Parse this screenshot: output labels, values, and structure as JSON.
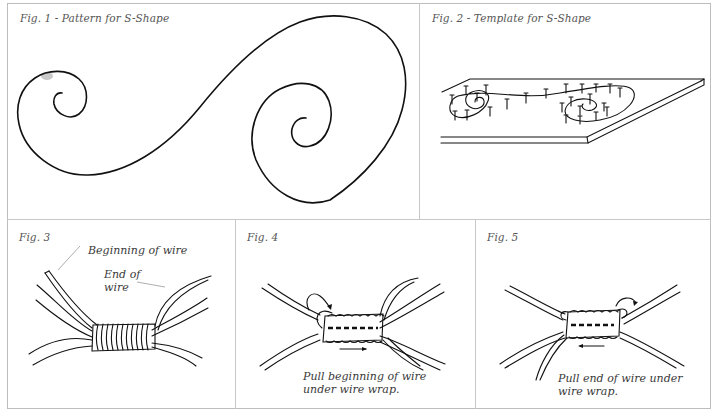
{
  "figures": [
    {
      "id": "fig1",
      "caption": "Fig. 1 - Pattern for S-Shape"
    },
    {
      "id": "fig2",
      "caption": "Fig. 2 - Template for S-Shape"
    },
    {
      "id": "fig3",
      "caption": "Fig. 3",
      "labels": {
        "beginning": "Beginning of wire",
        "end_line1": "End of",
        "end_line2": "wire"
      }
    },
    {
      "id": "fig4",
      "caption": "Fig. 4",
      "instruction_line1": "Pull beginning of wire",
      "instruction_line2": "under wire wrap."
    },
    {
      "id": "fig5",
      "caption": "Fig. 5",
      "instruction_line1": "Pull end of wire under",
      "instruction_line2": "wire wrap."
    }
  ],
  "colors": {
    "ink": "#111111",
    "caption": "#555555",
    "border": "#c8c8c8",
    "background": "#ffffff"
  }
}
